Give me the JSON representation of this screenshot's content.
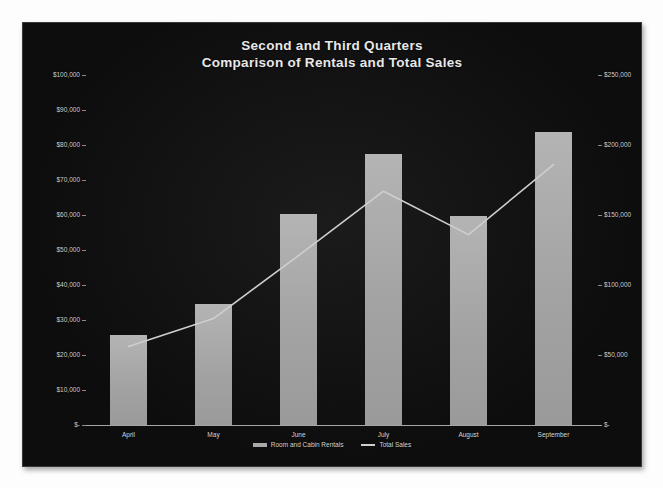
{
  "chart_data": {
    "type": "bar",
    "title": "Second and Third Quarters Comparison of Rentals and Total Sales",
    "title_lines": [
      "Second and Third Quarters",
      "Comparison of Rentals and Total Sales"
    ],
    "categories": [
      "April",
      "May",
      "June",
      "July",
      "August",
      "September"
    ],
    "series": [
      {
        "name": "Room and Cabin Rentals",
        "type": "bar",
        "axis": "left",
        "values": [
          25700,
          34600,
          60300,
          77400,
          59700,
          83700
        ]
      },
      {
        "name": "Total Sales",
        "type": "line",
        "axis": "right",
        "values": [
          56000,
          76000,
          121000,
          167000,
          136000,
          186000
        ]
      }
    ],
    "xlabel": "",
    "ylabel": "",
    "ylim": [
      0,
      100000
    ],
    "y2lim": [
      0,
      250000
    ],
    "grid": false,
    "legend_position": "bottom",
    "y_axis_left": {
      "ticks": [
        "$100,000",
        "$90,000",
        "$80,000",
        "$70,000",
        "$60,000",
        "$50,000",
        "$40,000",
        "$30,000",
        "$20,000",
        "$10,000",
        "$-"
      ],
      "tick_values": [
        100000,
        90000,
        80000,
        70000,
        60000,
        50000,
        40000,
        30000,
        20000,
        10000,
        0
      ]
    },
    "y_axis_right": {
      "ticks": [
        "$250,000",
        "$200,000",
        "$150,000",
        "$100,000",
        "$50,000",
        "$-"
      ],
      "tick_values": [
        250000,
        200000,
        150000,
        100000,
        50000,
        0
      ]
    },
    "legend": [
      {
        "label": "Room and Cabin Rentals",
        "marker": "bar",
        "color": "#a8a8a8"
      },
      {
        "label": "Total Sales",
        "marker": "line",
        "color": "#cfcfcf"
      }
    ],
    "colors": {
      "background": "#0d0d0d",
      "bar": "#a8a8a8",
      "line": "#cfcfcf",
      "text": "#d8d8d8",
      "axis": "#9a9a9a"
    }
  }
}
